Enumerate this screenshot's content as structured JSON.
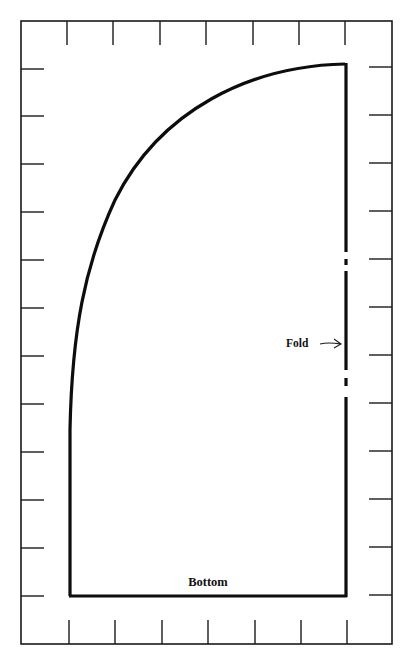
{
  "diagram": {
    "type": "sewing-pattern-piece",
    "labels": {
      "fold": "Fold",
      "bottom": "Bottom"
    },
    "colors": {
      "background": "#ffffff",
      "ink": "#111111"
    },
    "frame": {
      "x": 21,
      "y": 21,
      "width": 371,
      "height": 623
    },
    "grid": {
      "top_ticks_x": [
        67,
        113,
        160,
        206,
        253,
        299,
        345
      ],
      "bottom_ticks_x": [
        69,
        115,
        162,
        208,
        255,
        301,
        347
      ],
      "left_ticks_y": [
        69,
        116,
        164,
        212,
        260,
        308,
        356,
        404,
        452,
        500,
        548,
        596
      ],
      "right_ticks_y": [
        67,
        115,
        163,
        211,
        259,
        307,
        355,
        403,
        451,
        499,
        547,
        595
      ]
    }
  }
}
